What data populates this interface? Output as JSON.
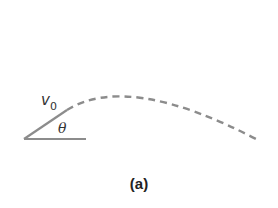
{
  "figure": {
    "caption": "(a)",
    "velocity_label": "v",
    "velocity_subscript": "0",
    "angle_label": "θ",
    "colors": {
      "line": "#8c8c8c",
      "text": "#333333",
      "background": "#ffffff"
    },
    "elements": [
      "launch angle with horizontal baseline",
      "dashed parabolic trajectory"
    ]
  }
}
